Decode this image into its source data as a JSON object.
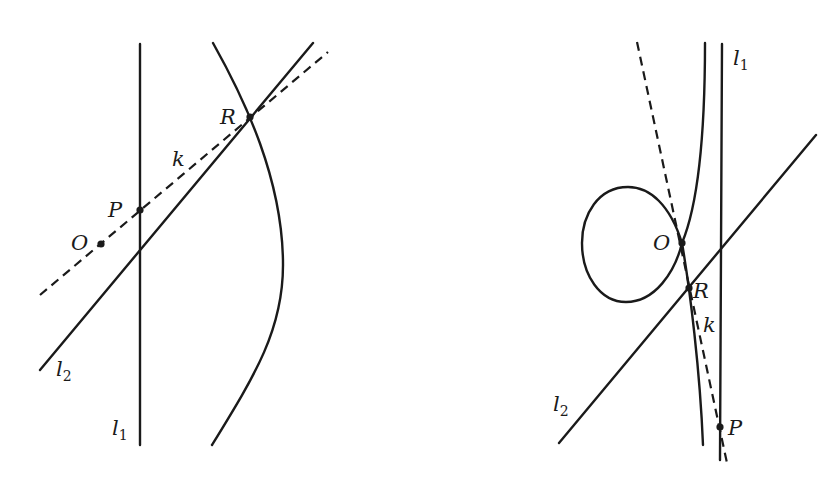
{
  "figures": [
    {
      "id": "left",
      "description": "Line l2 and dashed line k through O and P intersecting a curve at R; vertical line l1",
      "labels": {
        "R": "R",
        "k": "k",
        "P": "P",
        "O": "O",
        "l2_main": "l",
        "l2_sub": "2",
        "l1_main": "l",
        "l1_sub": "1"
      },
      "points": {
        "O": [
          101,
          244
        ],
        "P": [
          140,
          210
        ],
        "R": [
          250,
          117
        ]
      }
    },
    {
      "id": "right",
      "description": "Nodal cubic curve with loop at O; dashed tangent line k through O, R and P; lines l1 and l2",
      "labels": {
        "l1_main": "l",
        "l1_sub": "1",
        "O": "O",
        "R": "R",
        "k": "k",
        "l2_main": "l",
        "l2_sub": "2",
        "P": "P"
      },
      "points": {
        "O": [
          682,
          243
        ],
        "R": [
          689,
          288
        ],
        "P": [
          720,
          427
        ]
      }
    }
  ],
  "colors": {
    "ink": "#1a1a1a",
    "background": "#ffffff"
  }
}
